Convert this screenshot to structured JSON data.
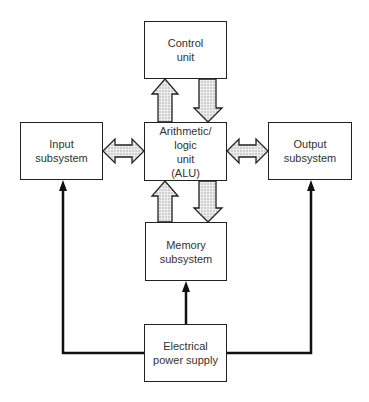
{
  "diagram": {
    "blocks": {
      "control": {
        "label": "Control\nunit"
      },
      "input": {
        "label": "Input\nsubsystem"
      },
      "alu": {
        "label": "Arithmetic/\nlogic\nunit\n(ALU)"
      },
      "output": {
        "label": "Output\nsubsystem"
      },
      "memory": {
        "label": "Memory\nsubsystem"
      },
      "power": {
        "label": "Electrical\npower supply"
      }
    },
    "connections": [
      {
        "from": "alu",
        "to": "control",
        "type": "data-bus-arrow"
      },
      {
        "from": "control",
        "to": "alu",
        "type": "data-bus-arrow"
      },
      {
        "from": "input",
        "to": "alu",
        "type": "bidirectional-bus-arrow"
      },
      {
        "from": "alu",
        "to": "output",
        "type": "bidirectional-bus-arrow"
      },
      {
        "from": "memory",
        "to": "alu",
        "type": "data-bus-arrow"
      },
      {
        "from": "alu",
        "to": "memory",
        "type": "data-bus-arrow"
      },
      {
        "from": "power",
        "to": "memory",
        "type": "power-line"
      },
      {
        "from": "power",
        "to": "input",
        "type": "power-line"
      },
      {
        "from": "power",
        "to": "output",
        "type": "power-line"
      }
    ],
    "colors": {
      "line": "#111111",
      "arrow_fill": "#d8d8d8",
      "border": "#222222"
    }
  }
}
